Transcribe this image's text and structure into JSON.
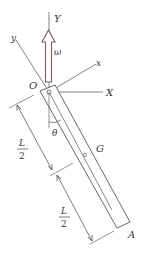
{
  "diagram": {
    "type": "rigid-body rotating rod",
    "labels": {
      "Y": "Y",
      "X": "X",
      "y": "y",
      "x": "x",
      "O": "O",
      "omega": "ω",
      "theta": "θ",
      "G": "G",
      "A": "A",
      "half_length_top_num": "L",
      "half_length_top_den": "2",
      "half_length_bottom_num": "L",
      "half_length_bottom_den": "2"
    },
    "colors": {
      "line": "#555555",
      "arrow": "#8a5a50",
      "text": "#333333"
    }
  }
}
